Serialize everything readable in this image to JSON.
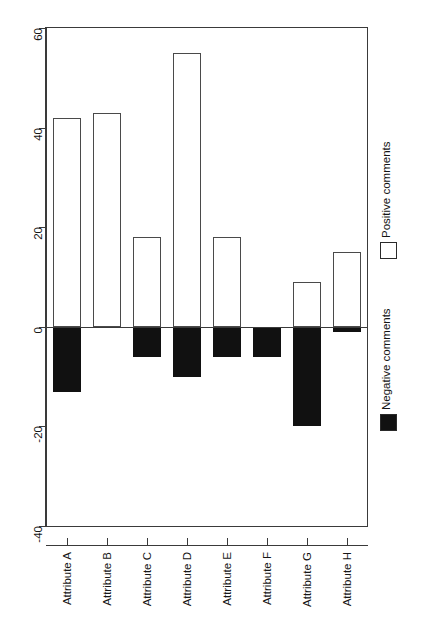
{
  "chart_data": {
    "type": "bar",
    "orientation": "vertical-bars-rotated-labels",
    "title": "",
    "subtitle": "",
    "xlabel": "",
    "ylabel": "",
    "categories": [
      "Attribute A",
      "Attribute B",
      "Attribute C",
      "Attribute D",
      "Attribute E",
      "Attribute F",
      "Attribute G",
      "Attribute H"
    ],
    "series": [
      {
        "name": "Positive comments",
        "color": "#ffffff",
        "edge_color": "#4a4a4a",
        "values": [
          42,
          43,
          18,
          55,
          18,
          0,
          9,
          15
        ]
      },
      {
        "name": "Negative comments",
        "color": "#111111",
        "edge_color": "#111111",
        "values": [
          -13,
          0,
          -6,
          -10,
          -6,
          -6,
          -20,
          -1
        ]
      }
    ],
    "ylim": [
      -40,
      60
    ],
    "yticks": [
      60,
      40,
      20,
      0,
      -20,
      -40
    ],
    "ytick_labels": [
      "60",
      "40",
      "20",
      "0",
      "-20",
      "-40"
    ],
    "grid": false,
    "legend": {
      "position": "right-outside",
      "entries": [
        {
          "label": "Positive comments",
          "swatch": "empty"
        },
        {
          "label": "Negative comments",
          "swatch": "filled"
        }
      ]
    },
    "baseline": 0
  }
}
